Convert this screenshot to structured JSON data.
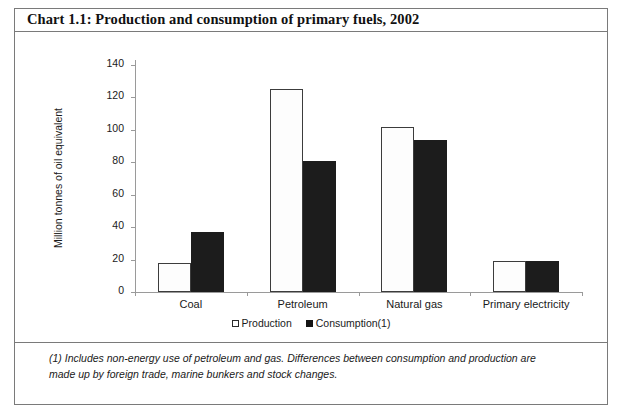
{
  "chart_title": "Chart 1.1: Production and consumption of primary fuels, 2002",
  "footnote": "(1) Includes non-energy use of petroleum and gas. Differences between consumption and production are made up by foreign trade, marine bunkers and stock changes.",
  "legend": {
    "production_label": "Production",
    "consumption_label": "Consumption(1)"
  },
  "chart_data": {
    "type": "bar",
    "title": "Chart 1.1: Production and consumption of primary fuels, 2002",
    "xlabel": "",
    "ylabel": "Million tonnes of oil equivalent",
    "categories": [
      "Coal",
      "Petroleum",
      "Natural gas",
      "Primary electricity"
    ],
    "series": [
      {
        "name": "Production",
        "values": [
          18,
          125,
          102,
          19
        ],
        "color": "#ffffff"
      },
      {
        "name": "Consumption(1)",
        "values": [
          37,
          81,
          94,
          19
        ],
        "color": "#1c1c1c"
      }
    ],
    "ylim": [
      0,
      140
    ],
    "yticks": [
      0,
      20,
      40,
      60,
      80,
      100,
      120,
      140
    ],
    "ytick_labels": [
      "0",
      "20",
      "40",
      "60",
      "80",
      "100",
      "120",
      "140"
    ],
    "grid": false,
    "legend_position": "bottom-center"
  }
}
